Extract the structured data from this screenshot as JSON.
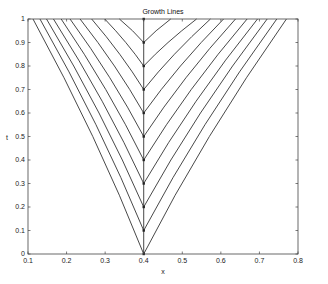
{
  "chart_data": {
    "type": "line",
    "title": "Growth Lines",
    "xlabel": "x",
    "ylabel": "t",
    "xlim": [
      0.1,
      0.8
    ],
    "ylim": [
      0,
      1
    ],
    "xticks": [
      0.1,
      0.2,
      0.3,
      0.4,
      0.5,
      0.6,
      0.7,
      0.8
    ],
    "xtick_labels": [
      "0.1",
      "0.2",
      "0.3",
      "0.4",
      "0.5",
      "0.6",
      "0.7",
      "0.8"
    ],
    "yticks": [
      0,
      0.1,
      0.2,
      0.3,
      0.4,
      0.5,
      0.6,
      0.7,
      0.8,
      0.9,
      1
    ],
    "ytick_labels": [
      "0",
      "0.1",
      "0.2",
      "0.3",
      "0.4",
      "0.5",
      "0.6",
      "0.7",
      "0.8",
      "0.9",
      "1"
    ],
    "grid": false,
    "legend": null,
    "trunk": {
      "x": 0.4,
      "t_start": 0,
      "t_end": 1
    },
    "branch_points": [
      {
        "x": 0.4,
        "t": 0.0
      },
      {
        "x": 0.4,
        "t": 0.1
      },
      {
        "x": 0.4,
        "t": 0.2
      },
      {
        "x": 0.4,
        "t": 0.3
      },
      {
        "x": 0.4,
        "t": 0.4
      },
      {
        "x": 0.4,
        "t": 0.5
      },
      {
        "x": 0.4,
        "t": 0.6
      },
      {
        "x": 0.4,
        "t": 0.7
      },
      {
        "x": 0.4,
        "t": 0.8
      },
      {
        "x": 0.4,
        "t": 0.9
      },
      {
        "x": 0.4,
        "t": 1.0
      }
    ],
    "series": [
      {
        "name": "branch t0=0.0",
        "t0": 0.0,
        "x_left_at_t1": 0.113,
        "x_right_at_t1": 0.77
      },
      {
        "name": "branch t0=0.1",
        "t0": 0.1,
        "x_left_at_t1": 0.131,
        "x_right_at_t1": 0.745
      },
      {
        "name": "branch t0=0.2",
        "t0": 0.2,
        "x_left_at_t1": 0.148,
        "x_right_at_t1": 0.72
      },
      {
        "name": "branch t0=0.3",
        "t0": 0.3,
        "x_left_at_t1": 0.166,
        "x_right_at_t1": 0.695
      },
      {
        "name": "branch t0=0.4",
        "t0": 0.4,
        "x_left_at_t1": 0.186,
        "x_right_at_t1": 0.668
      },
      {
        "name": "branch t0=0.5",
        "t0": 0.5,
        "x_left_at_t1": 0.209,
        "x_right_at_t1": 0.638
      },
      {
        "name": "branch t0=0.6",
        "t0": 0.6,
        "x_left_at_t1": 0.235,
        "x_right_at_t1": 0.607
      },
      {
        "name": "branch t0=0.7",
        "t0": 0.7,
        "x_left_at_t1": 0.265,
        "x_right_at_t1": 0.573
      },
      {
        "name": "branch t0=0.8",
        "t0": 0.8,
        "x_left_at_t1": 0.299,
        "x_right_at_t1": 0.537
      },
      {
        "name": "branch t0=0.9",
        "t0": 0.9,
        "x_left_at_t1": 0.337,
        "x_right_at_t1": 0.47
      }
    ],
    "line_color": "#333333"
  }
}
